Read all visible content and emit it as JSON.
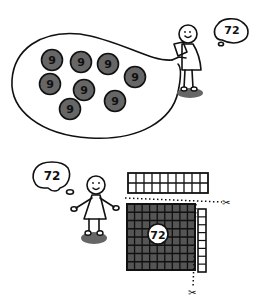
{
  "scene_top": {
    "thought_bubble": {
      "text": "72"
    },
    "group_bag": {
      "groups": [
        {
          "label": "9",
          "cx": 52,
          "cy": 60
        },
        {
          "label": "9",
          "cx": 81,
          "cy": 62
        },
        {
          "label": "9",
          "cx": 108,
          "cy": 64
        },
        {
          "label": "9",
          "cx": 50,
          "cy": 84
        },
        {
          "label": "9",
          "cx": 84,
          "cy": 90
        },
        {
          "label": "9",
          "cx": 135,
          "cy": 77
        },
        {
          "label": "9",
          "cx": 115,
          "cy": 101
        },
        {
          "label": "9",
          "cx": 70,
          "cy": 109
        }
      ]
    }
  },
  "scene_bottom": {
    "thought_bubble": {
      "text": "72"
    },
    "grid": {
      "label": "72",
      "rows": 8,
      "cols": 9,
      "top_strip": {
        "rows": 2,
        "cols": 10
      },
      "side_strip": {
        "rows": 8,
        "cols": 1
      }
    },
    "scissors": [
      "✂",
      "✂"
    ]
  },
  "colors": {
    "ink": "#111111",
    "fill_dark": "#555555",
    "shadow": "#666666",
    "paper": "#ffffff"
  }
}
